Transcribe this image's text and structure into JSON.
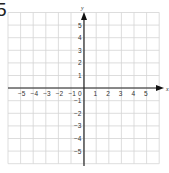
{
  "problem": {
    "number": "5"
  },
  "graph": {
    "x_axis_label": "x",
    "y_axis_label": "y",
    "x_ticks": [
      "−5",
      "−4",
      "−3",
      "−2",
      "−1",
      "0",
      "1",
      "2",
      "3",
      "4",
      "5"
    ],
    "y_ticks_positive": [
      "5",
      "4",
      "3",
      "2",
      "1"
    ],
    "y_ticks_negative": [
      "−1",
      "−2",
      "−3",
      "−4",
      "−5"
    ],
    "x_range": [
      -6,
      6
    ],
    "y_range": [
      -6,
      6
    ],
    "grid_color": "#d4d4d4",
    "axis_color": "#222222"
  }
}
